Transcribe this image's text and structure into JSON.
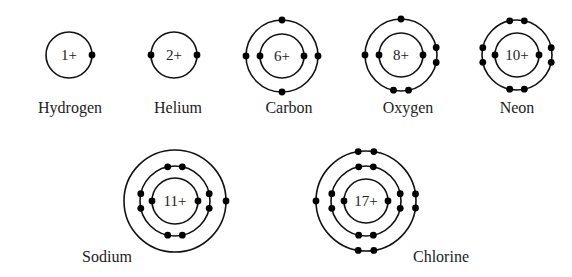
{
  "atoms": [
    {
      "name": "Hydrogen",
      "charge": "1+",
      "cx": 69,
      "cy": 55,
      "shells": [
        {
          "r": 23,
          "electrons": [
            0
          ]
        }
      ],
      "label": {
        "x": 70,
        "y": 113
      }
    },
    {
      "name": "Helium",
      "charge": "2+",
      "cx": 174,
      "cy": 55,
      "shells": [
        {
          "r": 23,
          "electrons": [
            0,
            180
          ]
        }
      ],
      "label": {
        "x": 178,
        "y": 113
      }
    },
    {
      "name": "Carbon",
      "charge": "6+",
      "cx": 282,
      "cy": 56,
      "shells": [
        {
          "r": 22,
          "electrons": [
            0,
            180
          ]
        },
        {
          "r": 36,
          "electrons": [
            0,
            90,
            180,
            270
          ]
        }
      ],
      "label": {
        "x": 289,
        "y": 113
      }
    },
    {
      "name": "Oxygen",
      "charge": "8+",
      "cx": 401,
      "cy": 55,
      "shells": [
        {
          "r": 22,
          "electrons": [
            0,
            180
          ]
        },
        {
          "r": 36,
          "electrons": [
            -12,
            12,
            102,
            78,
            180,
            270
          ]
        }
      ],
      "label": {
        "x": 408,
        "y": 113
      }
    },
    {
      "name": "Neon",
      "charge": "10+",
      "cx": 517,
      "cy": 55,
      "shells": [
        {
          "r": 22,
          "electrons": [
            0,
            180
          ]
        },
        {
          "r": 35,
          "electrons": [
            -12,
            12,
            78,
            102,
            168,
            192,
            258,
            282
          ]
        }
      ],
      "label": {
        "x": 517,
        "y": 113
      }
    },
    {
      "name": "Sodium",
      "charge": "11+",
      "cx": 175,
      "cy": 201,
      "shells": [
        {
          "r": 23,
          "electrons": [
            0,
            180
          ]
        },
        {
          "r": 35,
          "electrons": [
            -12,
            12,
            78,
            102,
            168,
            192,
            258,
            282
          ]
        },
        {
          "r": 51,
          "electrons": [
            0
          ]
        }
      ],
      "label": {
        "x": 107,
        "y": 262
      }
    },
    {
      "name": "Chlorine",
      "charge": "17+",
      "cx": 366,
      "cy": 201,
      "shells": [
        {
          "r": 22,
          "electrons": [
            0,
            180
          ]
        },
        {
          "r": 35,
          "electrons": [
            -12,
            12,
            78,
            102,
            168,
            192,
            258,
            282
          ]
        },
        {
          "r": 50,
          "electrons": [
            -8,
            8,
            81,
            99,
            180,
            261,
            279
          ]
        }
      ],
      "label": {
        "x": 441,
        "y": 262
      }
    }
  ]
}
